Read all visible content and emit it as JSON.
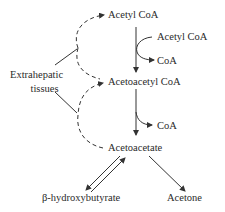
{
  "diagram": {
    "nodes": {
      "acetyl_coa": "Acetyl CoA",
      "acetyl_coa_input": "Acetyl CoA",
      "coa_release_1": "CoA",
      "acetoacetyl_coa": "Acetoacetyl CoA",
      "coa_release_2": "CoA",
      "acetoacetate": "Acetoacetate",
      "beta_hydroxybutyrate": "β-hydroxybutyrate",
      "acetone": "Acetone"
    },
    "side_label": {
      "line1": "Extrahepatic",
      "line2": "tissues"
    },
    "colors": {
      "line": "#333333",
      "text": "#2a2a2a",
      "background": "#ffffff"
    }
  }
}
